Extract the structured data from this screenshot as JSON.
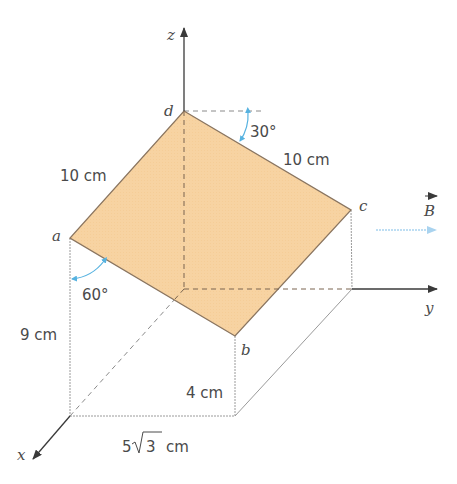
{
  "diagram": {
    "type": "3d-geometry",
    "axes": {
      "x": "x",
      "y": "y",
      "z": "z"
    },
    "vertices": {
      "a": "a",
      "b": "b",
      "c": "c",
      "d": "d"
    },
    "field_label": "B",
    "dimensions": {
      "ad_length": "10 cm",
      "dc_length": "10 cm",
      "a_height": "9 cm",
      "b_height": "4 cm",
      "base_width_prefix": "5",
      "base_width_radicand": "3",
      "base_width_unit": "cm"
    },
    "angles": {
      "top_angle": "30°",
      "left_angle": "60°"
    },
    "colors": {
      "plane_fill": "#f7d3a2",
      "plane_edge": "#8a7560",
      "axis": "#3a3a3a",
      "guide": "#9a9a9a",
      "angle_arc": "#56b2e0",
      "field_arrow": "#a9d3ef"
    }
  }
}
